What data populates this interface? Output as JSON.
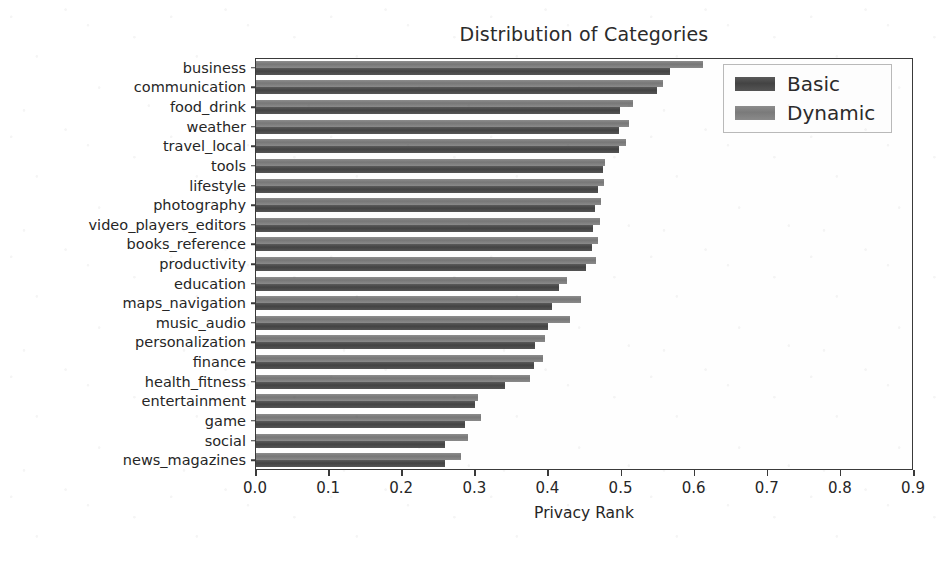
{
  "chart_data": {
    "type": "bar",
    "orientation": "horizontal",
    "title": "Distribution of Categories",
    "xlabel": "Privacy Rank",
    "ylabel": "",
    "xlim": [
      0.0,
      0.9
    ],
    "ylim": [
      0,
      21
    ],
    "grid": false,
    "legend_position": "upper right",
    "xticks": [
      "0.0",
      "0.1",
      "0.2",
      "0.3",
      "0.4",
      "0.5",
      "0.6",
      "0.7",
      "0.8",
      "0.9"
    ],
    "xtick_values": [
      0.0,
      0.1,
      0.2,
      0.3,
      0.4,
      0.5,
      0.6,
      0.7,
      0.8,
      0.9
    ],
    "categories": [
      "business",
      "communication",
      "food_drink",
      "weather",
      "travel_local",
      "tools",
      "lifestyle",
      "photography",
      "video_players_editors",
      "books_reference",
      "productivity",
      "education",
      "maps_navigation",
      "music_audio",
      "personalization",
      "finance",
      "health_fitness",
      "entertainment",
      "game",
      "social",
      "news_magazines"
    ],
    "series": [
      {
        "name": "Basic",
        "color": "#474747",
        "values": [
          0.566,
          0.548,
          0.498,
          0.497,
          0.496,
          0.474,
          0.468,
          0.464,
          0.461,
          0.459,
          0.452,
          0.415,
          0.405,
          0.4,
          0.382,
          0.38,
          0.341,
          0.3,
          0.286,
          0.258,
          0.259
        ]
      },
      {
        "name": "Dynamic",
        "color": "#808080",
        "values": [
          0.611,
          0.557,
          0.516,
          0.51,
          0.506,
          0.478,
          0.476,
          0.472,
          0.47,
          0.468,
          0.465,
          0.425,
          0.444,
          0.429,
          0.395,
          0.393,
          0.375,
          0.304,
          0.308,
          0.29,
          0.28
        ]
      }
    ]
  },
  "legend": {
    "items": [
      {
        "label": "Basic",
        "swatch": "basic"
      },
      {
        "label": "Dynamic",
        "swatch": "dynamic"
      }
    ]
  }
}
